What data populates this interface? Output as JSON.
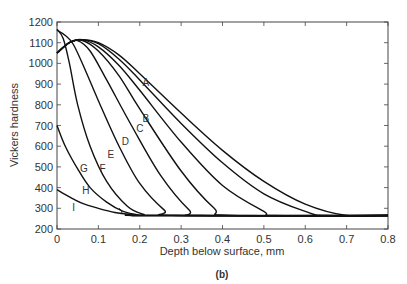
{
  "chart_data": {
    "type": "line",
    "title": "",
    "caption": "(b)",
    "xlabel": "Depth below surface, mm",
    "ylabel": "Vickers hardness",
    "xlim": [
      0,
      0.8
    ],
    "ylim": [
      200,
      1200
    ],
    "xticks": [
      0,
      0.1,
      0.2,
      0.3,
      0.4,
      0.5,
      0.6,
      0.7,
      0.8
    ],
    "xtick_labels": [
      "0",
      "0.1",
      "0.2",
      "0.3",
      "0.4",
      "0.5",
      "0.6",
      "0.7",
      "0.8"
    ],
    "yticks": [
      200,
      300,
      400,
      500,
      600,
      700,
      800,
      900,
      1000,
      1100,
      1200
    ],
    "ytick_labels": [
      "200",
      "300",
      "400",
      "500",
      "600",
      "700",
      "800",
      "900",
      "1000",
      "1100",
      "1200"
    ],
    "grid": false,
    "legend": "inline curve labels",
    "series": [
      {
        "name": "A",
        "label_pos": [
          0.215,
          910
        ],
        "points": [
          [
            0,
            1050
          ],
          [
            0.03,
            1100
          ],
          [
            0.06,
            1115
          ],
          [
            0.1,
            1100
          ],
          [
            0.15,
            1040
          ],
          [
            0.2,
            950
          ],
          [
            0.3,
            760
          ],
          [
            0.4,
            580
          ],
          [
            0.5,
            430
          ],
          [
            0.6,
            320
          ],
          [
            0.7,
            265
          ],
          [
            0.8,
            265
          ]
        ]
      },
      {
        "name": "B",
        "label_pos": [
          0.215,
          735
        ],
        "points": [
          [
            0,
            1050
          ],
          [
            0.03,
            1100
          ],
          [
            0.06,
            1115
          ],
          [
            0.1,
            1095
          ],
          [
            0.15,
            1020
          ],
          [
            0.2,
            920
          ],
          [
            0.3,
            710
          ],
          [
            0.4,
            520
          ],
          [
            0.5,
            370
          ],
          [
            0.6,
            285
          ],
          [
            0.65,
            265
          ],
          [
            0.8,
            265
          ]
        ]
      },
      {
        "name": "C",
        "label_pos": [
          0.2,
          690
        ],
        "points": [
          [
            0,
            1050
          ],
          [
            0.03,
            1100
          ],
          [
            0.06,
            1115
          ],
          [
            0.1,
            1080
          ],
          [
            0.15,
            990
          ],
          [
            0.2,
            870
          ],
          [
            0.3,
            620
          ],
          [
            0.4,
            410
          ],
          [
            0.5,
            285
          ],
          [
            0.53,
            265
          ],
          [
            0.8,
            265
          ]
        ]
      },
      {
        "name": "D",
        "label_pos": [
          0.165,
          625
        ],
        "points": [
          [
            0,
            1050
          ],
          [
            0.03,
            1100
          ],
          [
            0.06,
            1112
          ],
          [
            0.1,
            1060
          ],
          [
            0.15,
            940
          ],
          [
            0.2,
            780
          ],
          [
            0.3,
            480
          ],
          [
            0.38,
            300
          ],
          [
            0.42,
            265
          ],
          [
            0.8,
            265
          ]
        ]
      },
      {
        "name": "E",
        "label_pos": [
          0.13,
          560
        ],
        "points": [
          [
            0,
            1050
          ],
          [
            0.03,
            1100
          ],
          [
            0.05,
            1110
          ],
          [
            0.08,
            1060
          ],
          [
            0.12,
            920
          ],
          [
            0.18,
            700
          ],
          [
            0.25,
            460
          ],
          [
            0.32,
            290
          ],
          [
            0.35,
            265
          ],
          [
            0.8,
            265
          ]
        ]
      },
      {
        "name": "F",
        "label_pos": [
          0.11,
          495
        ],
        "points": [
          [
            0,
            1160
          ],
          [
            0.02,
            1135
          ],
          [
            0.04,
            1090
          ],
          [
            0.07,
            960
          ],
          [
            0.1,
            820
          ],
          [
            0.15,
            600
          ],
          [
            0.2,
            420
          ],
          [
            0.26,
            290
          ],
          [
            0.29,
            265
          ],
          [
            0.8,
            265
          ]
        ]
      },
      {
        "name": "G",
        "label_pos": [
          0.065,
          495
        ],
        "points": [
          [
            0,
            1165
          ],
          [
            0.015,
            1120
          ],
          [
            0.03,
            1000
          ],
          [
            0.05,
            800
          ],
          [
            0.08,
            600
          ],
          [
            0.12,
            430
          ],
          [
            0.17,
            310
          ],
          [
            0.21,
            270
          ],
          [
            0.23,
            265
          ],
          [
            0.8,
            265
          ]
        ]
      },
      {
        "name": "H",
        "label_pos": [
          0.07,
          390
        ],
        "points": [
          [
            0,
            700
          ],
          [
            0.02,
            600
          ],
          [
            0.05,
            490
          ],
          [
            0.08,
            400
          ],
          [
            0.12,
            330
          ],
          [
            0.16,
            285
          ],
          [
            0.2,
            267
          ],
          [
            0.23,
            265
          ],
          [
            0.8,
            265
          ]
        ]
      },
      {
        "name": "I",
        "label_pos": [
          0.04,
          305
        ],
        "points": [
          [
            0,
            390
          ],
          [
            0.03,
            355
          ],
          [
            0.06,
            325
          ],
          [
            0.1,
            300
          ],
          [
            0.14,
            280
          ],
          [
            0.18,
            270
          ],
          [
            0.22,
            265
          ],
          [
            0.8,
            265
          ]
        ]
      }
    ]
  }
}
